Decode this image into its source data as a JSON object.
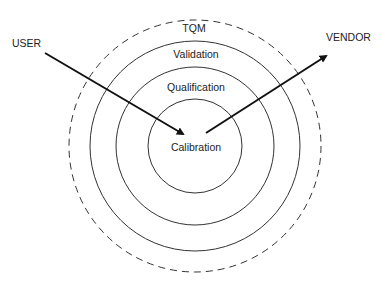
{
  "diagram": {
    "type": "concentric-circles",
    "layers": [
      {
        "label": "TQM",
        "style": "dashed",
        "cx": 195,
        "cy": 146,
        "r": 126,
        "label_y": 32
      },
      {
        "label": "Validation",
        "style": "solid",
        "cx": 195,
        "cy": 146,
        "r": 105,
        "label_y": 58
      },
      {
        "label": "Qualification",
        "style": "solid",
        "cx": 195,
        "cy": 146,
        "r": 79,
        "label_y": 91
      },
      {
        "label": "Calibration",
        "style": "solid",
        "cx": 195,
        "cy": 146,
        "r": 47,
        "label_y": 151
      }
    ],
    "actors": {
      "user": {
        "label": "USER",
        "x": 12,
        "y": 47,
        "arrow": {
          "x1": 45,
          "y1": 53,
          "x2": 183,
          "y2": 134
        }
      },
      "vendor": {
        "label": "VENDOR",
        "x": 326,
        "y": 41,
        "arrow": {
          "x1": 206,
          "y1": 133,
          "x2": 326,
          "y2": 56
        }
      }
    },
    "colors": {
      "stroke": "#222222",
      "background": "#ffffff"
    }
  }
}
